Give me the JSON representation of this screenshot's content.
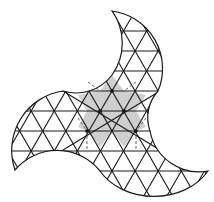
{
  "diagram": {
    "type": "geometric-tiling",
    "colors": {
      "background": "#ffffff",
      "stroke": "#1a1a1a",
      "shaded_region": "#cfcfcf",
      "dashed": "#555555"
    },
    "grid": {
      "row_spacing": 20,
      "side_length": 23.1,
      "rows_y": [
        31,
        51,
        71,
        91,
        111,
        131,
        151,
        171
      ]
    },
    "arm_tips": [
      {
        "name": "top",
        "x": 112,
        "y": 11
      },
      {
        "name": "left",
        "x": 15,
        "y": 170
      },
      {
        "name": "right",
        "x": 208,
        "y": 171
      }
    ],
    "highlight_nodes": [
      {
        "x": 112,
        "y": 91
      },
      {
        "x": 100,
        "y": 111
      },
      {
        "x": 124,
        "y": 111
      },
      {
        "x": 87,
        "y": 131
      },
      {
        "x": 136,
        "y": 131
      }
    ]
  }
}
